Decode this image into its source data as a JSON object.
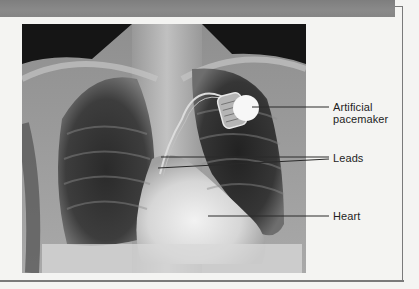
{
  "figure": {
    "image_description": "Chest X-ray showing an implanted artificial pacemaker with leads",
    "labels": [
      {
        "id": "pacemaker",
        "line1": "Artificial",
        "line2": "pacemaker"
      },
      {
        "id": "leads",
        "line1": "Leads"
      },
      {
        "id": "heart",
        "line1": "Heart"
      }
    ]
  },
  "colors": {
    "header_band": "#858585",
    "frame": "#7a7a7a",
    "background": "#f4f4f2",
    "label_text": "#1e1e1e",
    "callout_line": "#2a2a2a"
  }
}
